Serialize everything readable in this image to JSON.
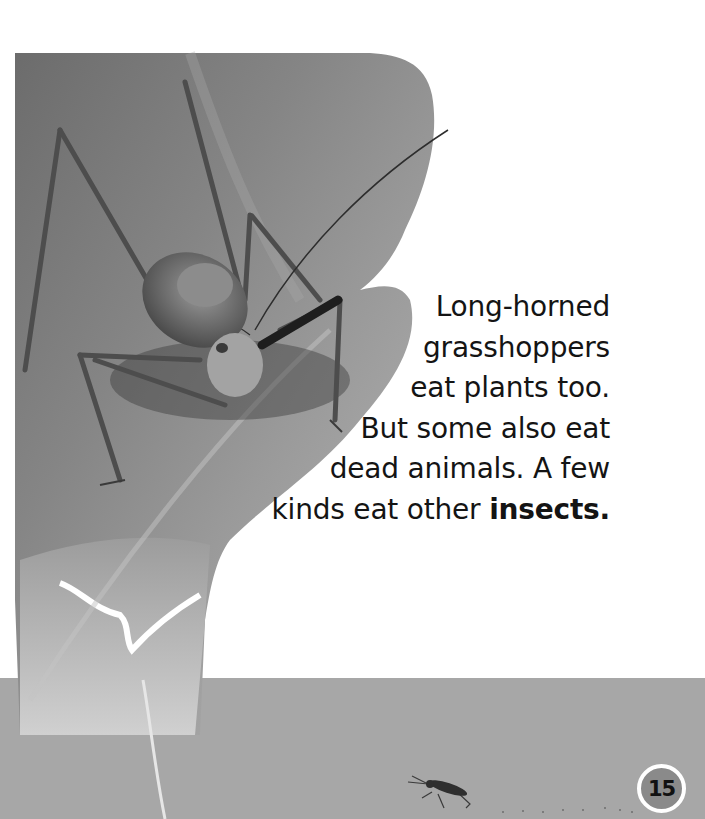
{
  "page": {
    "body_text": {
      "lines": [
        "Long-horned",
        "grasshoppers",
        "eat plants too.",
        "But some also eat",
        "dead animals. A few",
        "kinds eat other "
      ],
      "bold_word": "insects."
    },
    "page_number": "15",
    "photo": {
      "subject": "long-horned grasshopper on a leaf",
      "icon": "katydid-photo"
    },
    "footer_icon": "grasshopper-icon",
    "colors": {
      "band": "#a7a7a7",
      "page_circle": "#8a8a8a",
      "text": "#141414",
      "background": "#ffffff"
    }
  }
}
